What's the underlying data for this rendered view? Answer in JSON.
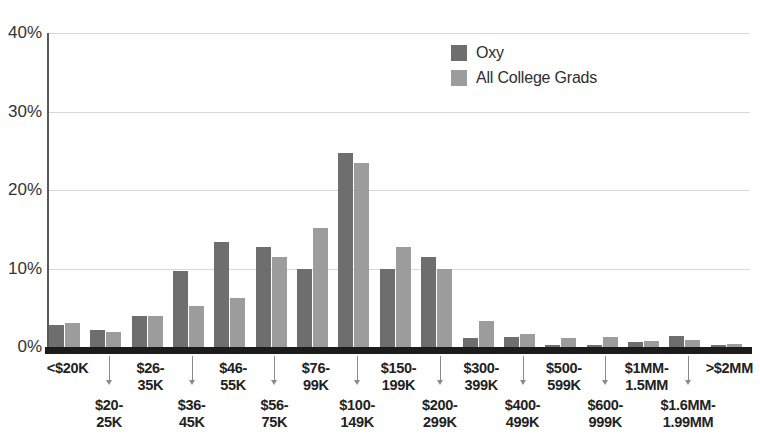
{
  "chart_data": {
    "type": "bar",
    "title": "",
    "subtitle": "",
    "xlabel": "",
    "ylabel": "",
    "ylim": [
      0,
      40
    ],
    "yticks": [
      "0%",
      "10%",
      "20%",
      "30%",
      "40%"
    ],
    "ytick_values": [
      0,
      10,
      20,
      30,
      40
    ],
    "grid": "horizontal",
    "legend_position": "top-center-right",
    "categories": [
      "<$20K",
      "$20-\n25K",
      "$26-\n35K",
      "$36-\n45K",
      "$46-\n55K",
      "$56-\n75K",
      "$76-\n99K",
      "$100-\n149K",
      "$150-\n199K",
      "$200-\n299K",
      "$300-\n399K",
      "$400-\n499K",
      "$500-\n599K",
      "$600-\n999K",
      "$1MM-\n1.5MM",
      "$1.6MM-\n1.99MM",
      ">$2MM"
    ],
    "series": [
      {
        "name": "Oxy",
        "color": "#6e6e6e",
        "values": [
          2.8,
          2.2,
          3.9,
          9.7,
          13.4,
          12.7,
          9.9,
          24.7,
          10.0,
          11.5,
          1.2,
          1.3,
          0.2,
          0.2,
          0.6,
          1.4,
          0.2
        ]
      },
      {
        "name": "All College Grads",
        "color": "#9c9c9c",
        "values": [
          3.0,
          1.9,
          3.9,
          5.2,
          6.2,
          11.5,
          15.1,
          23.4,
          12.7,
          9.9,
          3.3,
          1.7,
          1.2,
          1.3,
          0.8,
          0.9,
          0.4
        ]
      }
    ]
  },
  "legend": {
    "items": [
      {
        "label": "Oxy",
        "color": "#6e6e6e"
      },
      {
        "label": "All College Grads",
        "color": "#9c9c9c"
      }
    ]
  },
  "axis": {
    "y_ticks": [
      {
        "label": "40%",
        "value": 40
      },
      {
        "label": "30%",
        "value": 30
      },
      {
        "label": "20%",
        "value": 20
      },
      {
        "label": "10%",
        "value": 10
      },
      {
        "label": "0%",
        "value": 0
      }
    ]
  },
  "x_labels": [
    {
      "text": "<$20K",
      "row": "top"
    },
    {
      "text": "$20-\n25K",
      "row": "bottom"
    },
    {
      "text": "$26-\n35K",
      "row": "top"
    },
    {
      "text": "$36-\n45K",
      "row": "bottom"
    },
    {
      "text": "$46-\n55K",
      "row": "top"
    },
    {
      "text": "$56-\n75K",
      "row": "bottom"
    },
    {
      "text": "$76-\n99K",
      "row": "top"
    },
    {
      "text": "$100-\n149K",
      "row": "bottom"
    },
    {
      "text": "$150-\n199K",
      "row": "top"
    },
    {
      "text": "$200-\n299K",
      "row": "bottom"
    },
    {
      "text": "$300-\n399K",
      "row": "top"
    },
    {
      "text": "$400-\n499K",
      "row": "bottom"
    },
    {
      "text": "$500-\n599K",
      "row": "top"
    },
    {
      "text": "$600-\n999K",
      "row": "bottom"
    },
    {
      "text": "$1MM-\n1.5MM",
      "row": "top"
    },
    {
      "text": "$1.6MM-\n1.99MM",
      "row": "bottom"
    },
    {
      "text": ">$2MM",
      "row": "top"
    }
  ],
  "colors": {
    "series_oxy": "#6e6e6e",
    "series_all_grads": "#9c9c9c",
    "gridline": "#d8d8d8",
    "axis": "#5a5a5a",
    "baseline": "#1c1c1c",
    "text": "#222222"
  }
}
